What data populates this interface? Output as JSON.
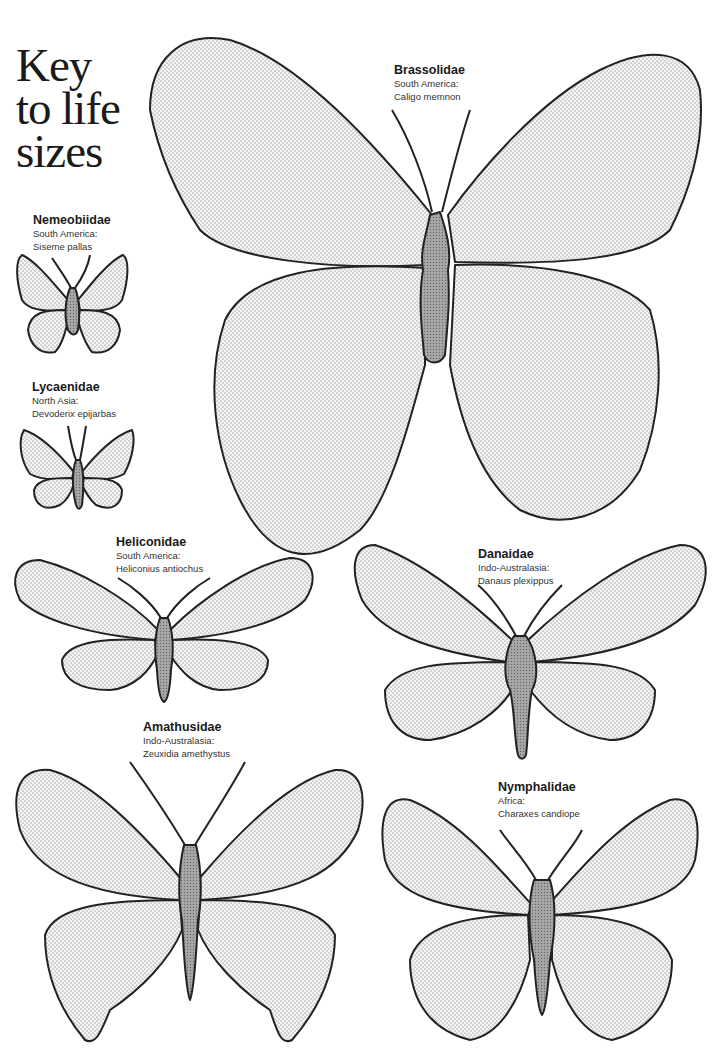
{
  "title": {
    "line1": "Key",
    "line2": "to life",
    "line3": "sizes"
  },
  "colors": {
    "wing_fill_dots": "#555555",
    "body_fill": "#9a9a9a",
    "outline": "#222222",
    "background": "#ffffff"
  },
  "butterflies": [
    {
      "family": "Brassolidae",
      "region": "South America:",
      "species": "Caligo memnon"
    },
    {
      "family": "Nemeobiidae",
      "region": "South America:",
      "species": "Siseme pallas"
    },
    {
      "family": "Lycaenidae",
      "region": "North Asia:",
      "species": "Devoderix epijarbas"
    },
    {
      "family": "Heliconidae",
      "region": "South America:",
      "species": "Heliconius antiochus"
    },
    {
      "family": "Danaidae",
      "region": "Indo-Australasia:",
      "species": "Danaus plexippus"
    },
    {
      "family": "Amathusidae",
      "region": "Indo-Australasia:",
      "species": "Zeuxidia amethystus"
    },
    {
      "family": "Nymphalidae",
      "region": "Africa:",
      "species": "Charaxes candiope"
    }
  ]
}
